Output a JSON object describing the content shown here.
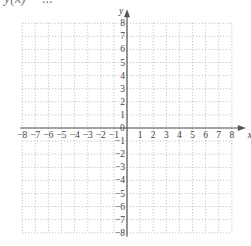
{
  "title": "y(x) = ...",
  "graph": {
    "x_axis_label": "x",
    "y_axis_label": "y",
    "x_min": -8,
    "x_max": 8,
    "y_min": -8,
    "y_max": 8,
    "origin_label": "0",
    "x_tick_labels": [
      "-8",
      "-7",
      "-6",
      "-5",
      "-4",
      "-3",
      "-2",
      "-1",
      "1",
      "2",
      "3",
      "4",
      "5",
      "6",
      "7",
      "8"
    ],
    "y_tick_labels": [
      "8",
      "7",
      "6",
      "5",
      "4",
      "3",
      "2",
      "1",
      "-1",
      "-2",
      "-3",
      "-4",
      "-5",
      "-6",
      "-7",
      "-8"
    ],
    "grid": "dotted",
    "colors": {
      "axis": "#555555",
      "grid": "#aaaaaa",
      "text": "#444444"
    }
  }
}
